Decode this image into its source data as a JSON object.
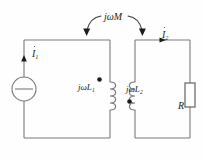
{
  "diagram": {
    "stroke_color": "#7a7a7a",
    "text_color": "#1c1c1c",
    "background": "#fefefe"
  },
  "labels": {
    "mutual_inductance": "jωM",
    "inductor1": "jωL",
    "inductor1_sub": "1",
    "inductor2": "jωL",
    "inductor2_sub": "2",
    "current1": "I",
    "current1_sub": "1",
    "current2": "I",
    "current2_sub": "2",
    "resistor": "R"
  },
  "components": {
    "source": {
      "name": "ac-voltage-source",
      "symbol": "circle-with-horizontal-bar"
    },
    "coil_left": {
      "name": "inductor-L1",
      "dot_position": "top-left"
    },
    "coil_right": {
      "name": "inductor-L2",
      "dot_position": "bottom-right"
    },
    "resistor_right": {
      "name": "resistor-R",
      "symbol": "rectangle"
    },
    "coupling": {
      "name": "mutual-coupling-arrows",
      "arrow_count": 2
    }
  }
}
